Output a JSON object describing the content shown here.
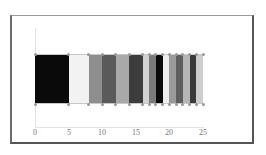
{
  "chart_data": {
    "type": "bar",
    "orientation": "horizontal-stacked",
    "title": "",
    "xlabel": "",
    "ylabel": "",
    "xlim": [
      0,
      25
    ],
    "xticks": [
      "0",
      "5",
      "10",
      "15",
      "20",
      "25"
    ],
    "grid": false,
    "legend": null,
    "segments": [
      {
        "start": 0,
        "end": 5,
        "color": "#0a0a0a"
      },
      {
        "start": 5,
        "end": 8,
        "color": "#f2f2f2"
      },
      {
        "start": 8,
        "end": 10,
        "color": "#8e8e8e"
      },
      {
        "start": 10,
        "end": 12,
        "color": "#5a5a5a"
      },
      {
        "start": 12,
        "end": 14,
        "color": "#a9a9a9"
      },
      {
        "start": 14,
        "end": 16,
        "color": "#3c3c3c"
      },
      {
        "start": 16,
        "end": 17,
        "color": "#d2d2d2"
      },
      {
        "start": 17,
        "end": 18,
        "color": "#7a7a7a"
      },
      {
        "start": 18,
        "end": 19,
        "color": "#0a0a0a"
      },
      {
        "start": 19,
        "end": 20,
        "color": "#eeeeee"
      },
      {
        "start": 20,
        "end": 21,
        "color": "#9a9a9a"
      },
      {
        "start": 21,
        "end": 22,
        "color": "#5e5e5e"
      },
      {
        "start": 22,
        "end": 23,
        "color": "#b6b6b6"
      },
      {
        "start": 23,
        "end": 24,
        "color": "#3a3a3a"
      },
      {
        "start": 24,
        "end": 25,
        "color": "#cdcdcd"
      }
    ]
  },
  "axis": {
    "ticks": [
      "0",
      "5",
      "10",
      "15",
      "20",
      "25"
    ]
  }
}
